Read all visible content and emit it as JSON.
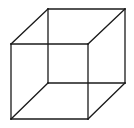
{
  "figure": {
    "type": "wireframe-cube",
    "background_color": "#ffffff",
    "stroke_color": "#1a1a1a",
    "stroke_width": 1.3,
    "front_face": {
      "x1": 11,
      "y1": 44,
      "x2": 88,
      "y2": 119
    },
    "back_face": {
      "x1": 48,
      "y1": 9,
      "x2": 125,
      "y2": 83
    }
  }
}
